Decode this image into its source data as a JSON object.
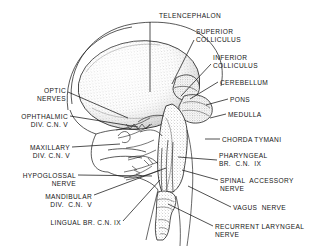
{
  "figure": {
    "background_color": "#ffffff",
    "ink_color": "#161616",
    "stipple_color": "#8f8f8f"
  },
  "labels": [
    {
      "id": "telencephalon",
      "text": "TELENCEPHALON",
      "align": "center",
      "x": 150,
      "y": 12,
      "w": 80
    },
    {
      "id": "superior-colliculus",
      "text": "SUPERIOR\nCOLLICULUS",
      "align": "left",
      "x": 196,
      "y": 28,
      "w": 70
    },
    {
      "id": "inferior-colliculus",
      "text": "INFERIOR\nCOLLICULUS",
      "align": "left",
      "x": 213,
      "y": 54,
      "w": 70
    },
    {
      "id": "cerebellum",
      "text": "CEREBELLUM",
      "align": "left",
      "x": 220,
      "y": 79,
      "w": 70
    },
    {
      "id": "pons",
      "text": "PONS",
      "align": "left",
      "x": 230,
      "y": 96,
      "w": 40
    },
    {
      "id": "medulla",
      "text": "MEDULLA",
      "align": "left",
      "x": 228,
      "y": 111,
      "w": 50
    },
    {
      "id": "chorda-tymani",
      "text": "CHORDA TYMANI",
      "align": "left",
      "x": 222,
      "y": 136,
      "w": 80
    },
    {
      "id": "pharyngeal-br-cn-ix",
      "text": "PHARYNGEAL\nBR.  C.N.  IX",
      "align": "left",
      "x": 219,
      "y": 152,
      "w": 80
    },
    {
      "id": "spinal-accessory",
      "text": "SPINAL  ACCESSORY\nNERVE",
      "align": "left",
      "x": 220,
      "y": 177,
      "w": 98
    },
    {
      "id": "vagus-nerve",
      "text": "VAGUS  NERVE",
      "align": "left",
      "x": 233,
      "y": 204,
      "w": 70
    },
    {
      "id": "recurrent-laryngeal",
      "text": "RECURRENT LARYNGEAL\nNERVE",
      "align": "left",
      "x": 215,
      "y": 223,
      "w": 112
    },
    {
      "id": "optic-nerves",
      "text": "OPTIC\nNERVES",
      "align": "right",
      "x": 14,
      "y": 87,
      "w": 52
    },
    {
      "id": "ophthalmic-div-cn-v",
      "text": "OPHTHALMIC\nDIV. C.N. V",
      "align": "right",
      "x": 5,
      "y": 113,
      "w": 63
    },
    {
      "id": "maxillary-div-cn-v",
      "text": "MAXILLARY\nDIV. C.N. V",
      "align": "right",
      "x": 10,
      "y": 144,
      "w": 60
    },
    {
      "id": "hypoglossal-nerve",
      "text": "HYPOGLOSSAL\nNERVE",
      "align": "right",
      "x": 8,
      "y": 172,
      "w": 68
    },
    {
      "id": "mandibular-div-cn-v",
      "text": "MANDIBULAR\nDIV.  C.N.  V",
      "align": "right",
      "x": 24,
      "y": 193,
      "w": 68
    },
    {
      "id": "lingual-br-cn-ix",
      "text": "LINGUAL BR. C.N. IX",
      "align": "right",
      "x": 33,
      "y": 219,
      "w": 88
    }
  ],
  "leader_lines": [
    {
      "id": "telencephalon-leader",
      "points": "150,22 150,92"
    },
    {
      "id": "superior-colliculus-leader",
      "points": "194,40 172,84"
    },
    {
      "id": "inferior-colliculus-leader",
      "points": "211,64 181,96"
    },
    {
      "id": "cerebellum-leader",
      "points": "218,82 190,99"
    },
    {
      "id": "pons-leader",
      "points": "228,99 206,105"
    },
    {
      "id": "medulla-leader",
      "points": "226,114 210,118"
    },
    {
      "id": "chorda-tymani-leader",
      "points": "220,139 205,139"
    },
    {
      "id": "pharyngeal-leader",
      "points": "217,160 178,157"
    },
    {
      "id": "spinal-accessory-leader",
      "points": "218,180 182,170"
    },
    {
      "id": "vagus-leader",
      "points": "231,207 188,186"
    },
    {
      "id": "recurrent-laryngeal-leader",
      "points": "213,226 168,204"
    },
    {
      "id": "optic-nerves-leader",
      "points": "68,92 128,118"
    },
    {
      "id": "ophthalmic-leader",
      "points": "70,116 138,127"
    },
    {
      "id": "maxillary-leader",
      "points": "72,147 120,144"
    },
    {
      "id": "hypoglossal-leader",
      "points": "78,175 152,176"
    },
    {
      "id": "mandibular-leader",
      "points": "94,195 166,168"
    },
    {
      "id": "lingual-leader",
      "points": "123,221 160,180"
    }
  ]
}
